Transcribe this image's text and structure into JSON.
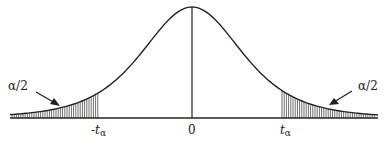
{
  "diagram": {
    "type": "t-distribution two-tailed critical region",
    "labels": {
      "left_tail": "α/2",
      "right_tail": "α/2",
      "left_critical": "-t",
      "right_critical": "t",
      "subscript": "α",
      "center": "0"
    },
    "colors": {
      "stroke": "#222222",
      "background": "#ffffff"
    }
  }
}
